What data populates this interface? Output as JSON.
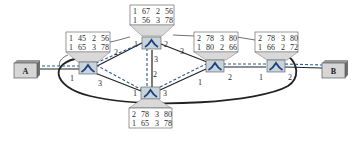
{
  "diagram": {
    "type": "network-switch-topology",
    "colors": {
      "link": "#222222",
      "path_dashed": "#2a5a9a",
      "switch_fill": "#c9d3dc",
      "switch_glyph": "#1d3f7a",
      "table_fill": "#ffffff",
      "funnel_fill": "#d9d9d9"
    },
    "hosts": [
      {
        "id": "A",
        "label": "A"
      },
      {
        "id": "B",
        "label": "B"
      }
    ],
    "switches": [
      {
        "id": "S1",
        "table": [
          [
            "1",
            "45",
            "2",
            "56"
          ],
          [
            "1",
            "65",
            "3",
            "78"
          ]
        ],
        "ports": {
          "p1": "1",
          "p2": "2",
          "p3": "3"
        }
      },
      {
        "id": "S2",
        "table": [
          [
            "1",
            "67",
            "2",
            "56"
          ],
          [
            "1",
            "56",
            "3",
            "78"
          ]
        ],
        "ports": {
          "p1": "1",
          "p2": "2",
          "p3": "3"
        }
      },
      {
        "id": "S3",
        "table": [
          [
            "2",
            "78",
            "3",
            "80"
          ],
          [
            "1",
            "65",
            "3",
            "78"
          ]
        ],
        "ports": {
          "p1": "1",
          "p2": "2",
          "p3": "3"
        }
      },
      {
        "id": "S4",
        "table": [
          [
            "2",
            "78",
            "3",
            "80"
          ],
          [
            "1",
            "80",
            "2",
            "66"
          ]
        ],
        "ports": {
          "p1": "1",
          "p2": "2",
          "p3": "3"
        }
      },
      {
        "id": "S5",
        "table": [
          [
            "2",
            "78",
            "3",
            "80"
          ],
          [
            "1",
            "66",
            "2",
            "72"
          ]
        ],
        "ports": {
          "p1": "1",
          "p2": "2"
        }
      }
    ],
    "links": [
      {
        "from": "A",
        "to": "S1"
      },
      {
        "from": "S1",
        "to": "S2",
        "ports": [
          "2",
          "1"
        ]
      },
      {
        "from": "S1",
        "to": "S3",
        "ports": [
          "3",
          "1"
        ]
      },
      {
        "from": "S2",
        "to": "S3",
        "ports": [
          "3",
          "2"
        ]
      },
      {
        "from": "S2",
        "to": "S4",
        "ports": [
          "2",
          "3"
        ]
      },
      {
        "from": "S3",
        "to": "S4",
        "ports": [
          "3",
          "1"
        ]
      },
      {
        "from": "S4",
        "to": "S5",
        "ports": [
          "2",
          "1"
        ]
      },
      {
        "from": "S5",
        "to": "B",
        "ports": [
          "2",
          ""
        ]
      },
      {
        "from": "S1",
        "to": "S5",
        "ports": [
          "1",
          "2"
        ],
        "style": "curved-loop"
      }
    ],
    "path_highlight": "A-S1-S2-S3-S4-S5-B"
  }
}
